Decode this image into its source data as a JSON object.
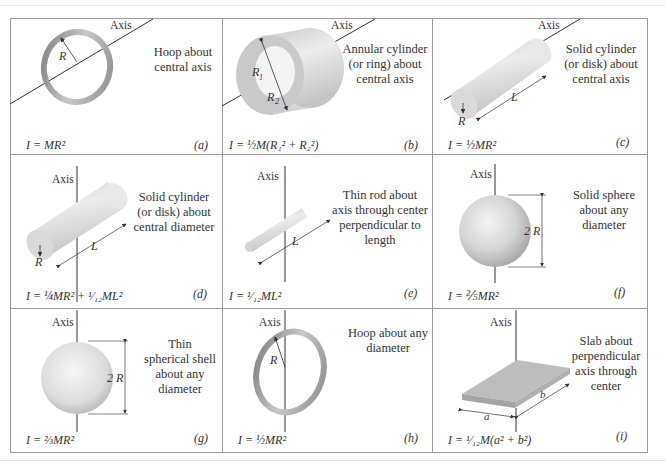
{
  "figure": {
    "panels": [
      {
        "id": "a",
        "axis_label": "Axis",
        "description": [
          "Hoop about",
          "central axis"
        ],
        "formula": "I = MR²",
        "tag": "(a)",
        "dims": [
          "R"
        ]
      },
      {
        "id": "b",
        "axis_label": "Axis",
        "description": [
          "Annular cylinder",
          "(or ring) about",
          "central axis"
        ],
        "formula": "I = ½M(R₁² + R₂²)",
        "tag": "(b)",
        "dims": [
          "R1",
          "R2"
        ]
      },
      {
        "id": "c",
        "axis_label": "Axis",
        "description": [
          "Solid cylinder",
          "(or disk) about",
          "central axis"
        ],
        "formula": "I = ½MR²",
        "tag": "(c)",
        "dims": [
          "R",
          "L"
        ]
      },
      {
        "id": "d",
        "axis_label": "Axis",
        "description": [
          "Solid cylinder",
          "(or disk) about",
          "central diameter"
        ],
        "formula": "I = ¼MR² + ¹⁄₁₂ML²",
        "tag": "(d)",
        "dims": [
          "R",
          "L"
        ]
      },
      {
        "id": "e",
        "axis_label": "Axis",
        "description": [
          "Thin rod about",
          "axis through center",
          "perpendicular to",
          "length"
        ],
        "formula": "I = ¹⁄₁₂ML²",
        "tag": "(e)",
        "dims": [
          "L"
        ]
      },
      {
        "id": "f",
        "axis_label": "Axis",
        "description": [
          "Solid sphere",
          "about any",
          "diameter"
        ],
        "formula": "I = ⅖MR²",
        "tag": "(f)",
        "dims": [
          "2R"
        ]
      },
      {
        "id": "g",
        "axis_label": "Axis",
        "description": [
          "Thin",
          "spherical shell",
          "about any",
          "diameter"
        ],
        "formula": "I = ⅔MR²",
        "tag": "(g)",
        "dims": [
          "2R"
        ]
      },
      {
        "id": "h",
        "axis_label": "Axis",
        "description": [
          "Hoop about any",
          "diameter"
        ],
        "formula": "I = ½MR²",
        "tag": "(h)",
        "dims": [
          "R"
        ]
      },
      {
        "id": "i",
        "axis_label": "Axis",
        "description": [
          "Slab about",
          "perpendicular",
          "axis through",
          "center"
        ],
        "formula": "I = ¹⁄₁₂M(a² + b²)",
        "tag": "(i)",
        "dims": [
          "a",
          "b"
        ]
      }
    ]
  },
  "colors": {
    "border": "#9a9a9a",
    "shape_light": "#ececec",
    "shape_mid": "#c8c8c8",
    "shape_dark": "#9c9c9c",
    "text": "#333333"
  }
}
